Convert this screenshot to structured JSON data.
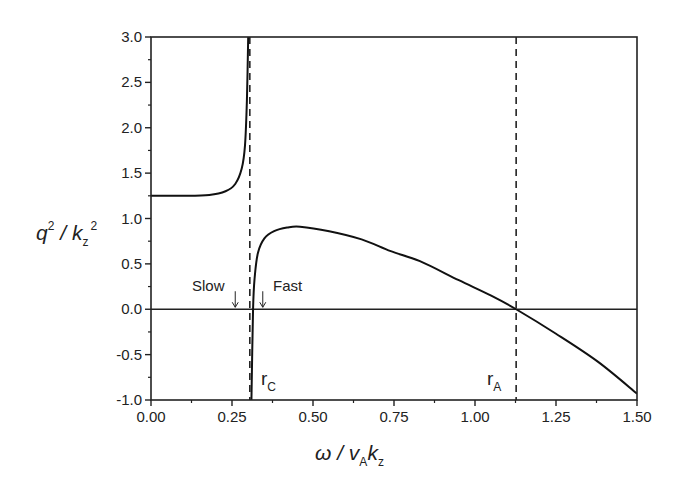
{
  "chart_data": {
    "type": "line",
    "title": "",
    "xlabel": "ω / v_A k_z",
    "ylabel": "q^2 / k_z^2",
    "xlim": [
      0.0,
      1.5
    ],
    "ylim": [
      -1.0,
      3.0
    ],
    "grid": false,
    "legend": null,
    "x_ticks": [
      "0.00",
      "0.25",
      "0.50",
      "0.75",
      "1.00",
      "1.25",
      "1.50"
    ],
    "y_ticks": [
      "-1.0",
      "-0.5",
      "0.0",
      "0.5",
      "1.0",
      "1.5",
      "2.0",
      "2.5",
      "3.0"
    ],
    "series": [
      {
        "name": "slow branch",
        "x": [
          0.0,
          0.1,
          0.18,
          0.23,
          0.26,
          0.28,
          0.29,
          0.296,
          0.3
        ],
        "y": [
          1.25,
          1.25,
          1.26,
          1.3,
          1.38,
          1.55,
          1.8,
          2.3,
          3.0
        ]
      },
      {
        "name": "fast branch",
        "x": [
          0.31,
          0.315,
          0.32,
          0.33,
          0.35,
          0.38,
          0.42,
          0.46,
          0.55,
          0.65,
          0.74,
          0.83,
          0.95,
          1.05,
          1.127,
          1.25,
          1.38,
          1.5
        ],
        "y": [
          -1.0,
          0.0,
          0.35,
          0.62,
          0.78,
          0.86,
          0.9,
          0.91,
          0.86,
          0.77,
          0.64,
          0.53,
          0.32,
          0.15,
          0.0,
          -0.27,
          -0.58,
          -0.93
        ]
      }
    ],
    "reference_lines": [
      {
        "type": "vertical",
        "x": 0.305,
        "style": "dashed",
        "label": "r_C"
      },
      {
        "type": "vertical",
        "x": 1.127,
        "style": "dashed",
        "label": "r_A"
      },
      {
        "type": "horizontal",
        "y": 0.0,
        "style": "solid"
      }
    ],
    "annotations": [
      {
        "text": "Slow",
        "arrow_x": 0.26,
        "arrow_y": 0.0
      },
      {
        "text": "Fast",
        "arrow_x": 0.345,
        "arrow_y": 0.0
      },
      {
        "text": "r_C",
        "x": 0.33,
        "y": -0.9
      },
      {
        "text": "r_A",
        "x": 1.07,
        "y": -0.9
      }
    ]
  },
  "labels": {
    "x_axis": {
      "main": "ω / v",
      "sub1": "A",
      "main2": "k",
      "sub2": "z"
    },
    "y_axis": {
      "main": "q",
      "sup1": "2",
      "main2": " / k",
      "sub": "z",
      "sup2": "2"
    },
    "slow": "Slow",
    "fast": "Fast",
    "rc": {
      "main": "r",
      "sub": "C"
    },
    "ra": {
      "main": "r",
      "sub": "A"
    }
  }
}
